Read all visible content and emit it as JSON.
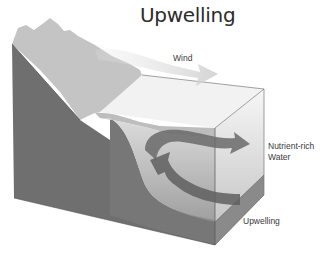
{
  "diagram": {
    "title": "Upwelling",
    "labels": {
      "wind": "Wind",
      "nutrient_line1": "Nutrient-rich",
      "nutrient_line2": "Water",
      "upwelling": "Upwelling"
    },
    "elements": [
      {
        "name": "land-slope",
        "description": "Coastal land cross-section sloping down into ocean"
      },
      {
        "name": "wind-arrow",
        "description": "Light arrow blowing offshore over surface"
      },
      {
        "name": "water-block",
        "description": "Transparent ocean block"
      },
      {
        "name": "surface-current-arrow",
        "description": "Curved arrow moving surface water offshore"
      },
      {
        "name": "upwelling-arrow",
        "description": "Curved arrow bringing deep water up along slope"
      }
    ],
    "colors": {
      "land_top": "#c8c8c8",
      "land_side": "#6e6e6e",
      "seafloor_side": "#7a7a7a",
      "water": "#d9d9d9",
      "arrow": "#6a6a6a",
      "text": "#3a3a3a"
    }
  }
}
